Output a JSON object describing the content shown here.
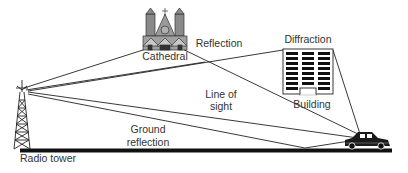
{
  "labels": {
    "cathedral": "Cathedral",
    "reflection": "Reflection",
    "diffraction": "Diffraction",
    "building": "Building",
    "line_of_sight_1": "Line of",
    "line_of_sight_2": "sight",
    "ground_reflection_1": "Ground",
    "ground_reflection_2": "reflection",
    "radio_tower": "Radio tower"
  },
  "paths": [
    {
      "name": "reflection-path",
      "label": "Reflection",
      "points": [
        [
          24,
          88
        ],
        [
          168,
          42
        ],
        [
          362,
          136
        ]
      ]
    },
    {
      "name": "reflection-path-2",
      "label": "Reflection",
      "points": [
        [
          26,
          90
        ],
        [
          205,
          62
        ]
      ]
    },
    {
      "name": "diffraction-path",
      "label": "Diffraction",
      "points": [
        [
          28,
          91
        ],
        [
          283,
          50
        ],
        [
          333,
          50
        ],
        [
          360,
          134
        ]
      ]
    },
    {
      "name": "line-of-sight-path",
      "label": "Line of sight",
      "points": [
        [
          28,
          92
        ],
        [
          358,
          138
        ]
      ]
    },
    {
      "name": "ground-reflection-path",
      "label": "Ground reflection",
      "points": [
        [
          28,
          93
        ],
        [
          305,
          148
        ],
        [
          356,
          140
        ]
      ]
    }
  ],
  "colors": {
    "line": "#222222",
    "text": "#333333",
    "ground": "#111111"
  }
}
